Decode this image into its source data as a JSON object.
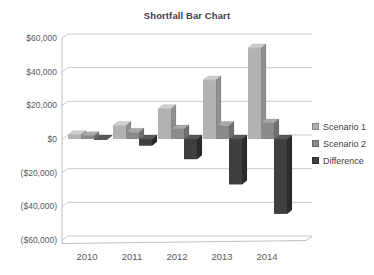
{
  "chart_data": {
    "type": "bar",
    "style": "3d-clustered-column",
    "title": "Shortfall Bar Chart",
    "categories": [
      "2010",
      "2011",
      "2012",
      "2013",
      "2014"
    ],
    "series": [
      {
        "name": "Scenario 1",
        "values": [
          2500,
          8000,
          18000,
          35000,
          54000
        ],
        "color": "#b2b2b2",
        "top_color": "#cecece",
        "side_color": "#8f8f8f"
      },
      {
        "name": "Scenario 2",
        "values": [
          2000,
          4000,
          6000,
          8000,
          9500
        ],
        "color": "#8a8a8a",
        "top_color": "#a9a9a9",
        "side_color": "#6f6f6f"
      },
      {
        "name": "Difference",
        "values": [
          -500,
          -4000,
          -12000,
          -27000,
          -44500
        ],
        "color": "#3f3f3f",
        "top_color": "#5a5a5a",
        "side_color": "#2b2b2b"
      }
    ],
    "ylim": [
      -60000,
      60000
    ],
    "y_tick_step": 20000,
    "y_tick_labels": [
      "$60,000",
      "$40,000",
      "$20,000",
      "$0",
      "($20,000)",
      "($40,000)",
      "($60,000)"
    ],
    "xlabel": "",
    "ylabel": "",
    "grid": true,
    "legend_position": "right",
    "colors": {
      "background": "#ffffff",
      "gridline": "#c4c4c4",
      "wall_line": "#b8b8b8",
      "axis_text": "#595959",
      "title_text": "#3f3f3f",
      "legend_text": "#404040"
    }
  }
}
